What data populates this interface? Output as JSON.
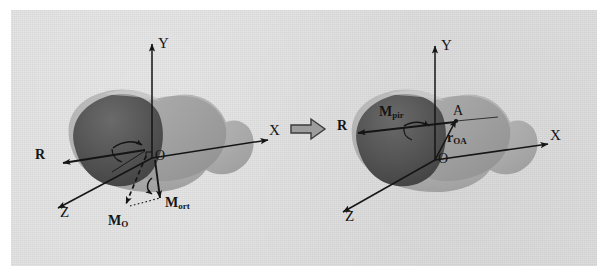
{
  "figure": {
    "kind": "mechanics-diagram",
    "caption_present": false,
    "background_color": "#dcdcdc",
    "page_color": "#ffffff",
    "ink_color": "#151515",
    "body_light_color": "#b4b4b4",
    "body_mid_color": "#8e8e8e",
    "body_dark_color": "#4a4a4a",
    "transition_arrow": {
      "name": "implies-arrow",
      "glyph": "⇒",
      "direction": "right"
    },
    "panels": [
      {
        "id": "left",
        "name": "force-moment-about-origin",
        "axes": [
          {
            "name": "y-axis",
            "label": "Y"
          },
          {
            "name": "x-axis",
            "label": "X"
          },
          {
            "name": "z-axis",
            "label": "Z"
          }
        ],
        "origin_label": "O",
        "vectors": [
          {
            "name": "resultant-force",
            "label": "R",
            "subscript": ""
          },
          {
            "name": "moment-about-origin",
            "label": "M",
            "subscript": "O"
          },
          {
            "name": "orthogonal-moment",
            "label": "M",
            "subscript": "ort"
          }
        ]
      },
      {
        "id": "right",
        "name": "force-and-moment-at-point-A",
        "axes": [
          {
            "name": "y-axis",
            "label": "Y"
          },
          {
            "name": "x-axis",
            "label": "X"
          },
          {
            "name": "z-axis",
            "label": "Z"
          }
        ],
        "origin_label": "O",
        "point_label": "A",
        "vectors": [
          {
            "name": "resultant-force",
            "label": "R",
            "subscript": ""
          },
          {
            "name": "principal-moment",
            "label": "M",
            "subscript": "pir"
          },
          {
            "name": "position-vector",
            "label": "r",
            "subscript": "OA"
          }
        ]
      }
    ]
  }
}
